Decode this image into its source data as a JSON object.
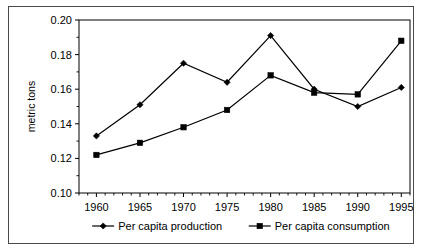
{
  "chart_data": {
    "type": "line",
    "title": "",
    "xlabel": "",
    "ylabel": "metric tons",
    "x": [
      1960,
      1965,
      1970,
      1975,
      1980,
      1985,
      1990,
      1995
    ],
    "categories": [
      "1960",
      "1965",
      "1970",
      "1975",
      "1980",
      "1985",
      "1990",
      "1995"
    ],
    "xlim": [
      1958,
      1996
    ],
    "ylim": [
      0.1,
      0.2
    ],
    "ytick_labels": [
      "0.20",
      "0.18",
      "0.16",
      "0.14",
      "0.12",
      "0.10"
    ],
    "ytick_values": [
      0.2,
      0.18,
      0.16,
      0.14,
      0.12,
      0.1
    ],
    "grid": false,
    "legend_position": "bottom",
    "series": [
      {
        "name": "Per capita production",
        "marker": "diamond",
        "color": "#000000",
        "values": [
          0.133,
          0.151,
          0.175,
          0.164,
          0.191,
          0.16,
          0.15,
          0.161
        ]
      },
      {
        "name": "Per capita consumption",
        "marker": "square",
        "color": "#000000",
        "values": [
          0.122,
          0.129,
          0.138,
          0.148,
          0.168,
          0.158,
          0.157,
          0.188
        ]
      }
    ]
  },
  "figure": {
    "axis_title": "metric tons",
    "border_color": "#4a4a4a",
    "legend": [
      {
        "label": "Per capita production",
        "marker": "diamond"
      },
      {
        "label": "Per capita consumption",
        "marker": "square"
      }
    ]
  }
}
